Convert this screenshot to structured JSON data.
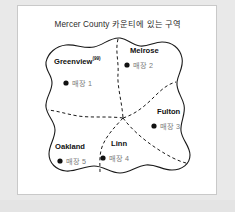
{
  "figure": {
    "title": "Mercer County 카운티에 있는 구역",
    "background_color": "#e9e9e9",
    "panel_color": "#ffffff",
    "frame_color": "#c9c9c9"
  },
  "map": {
    "outline_style": "solid",
    "outline_color": "#1a1a1a",
    "internal_border_style": "dashed",
    "internal_border_color": "#1a1a1a",
    "marker_symbol": "●",
    "marker_color": "#111111",
    "districts": [
      {
        "name": "Greenview",
        "superscript": "(99)",
        "store_label": "매장 1",
        "name_x": 36,
        "name_y": 55,
        "store_x": 45,
        "store_y": 76
      },
      {
        "name": "Melrose",
        "superscript": "",
        "store_label": "매장 2",
        "name_x": 112,
        "name_y": 44,
        "store_x": 106,
        "store_y": 58
      },
      {
        "name": "Fulton",
        "superscript": "",
        "store_label": "매장 3",
        "name_x": 140,
        "name_y": 105,
        "store_x": 133,
        "store_y": 119
      },
      {
        "name": "Linn",
        "superscript": "",
        "store_label": "매장 4",
        "name_x": 93,
        "name_y": 137,
        "store_x": 82,
        "store_y": 151
      },
      {
        "name": "Oakland",
        "superscript": "",
        "store_label": "매장 5",
        "name_x": 38,
        "name_y": 140,
        "store_x": 39,
        "store_y": 154
      }
    ]
  }
}
